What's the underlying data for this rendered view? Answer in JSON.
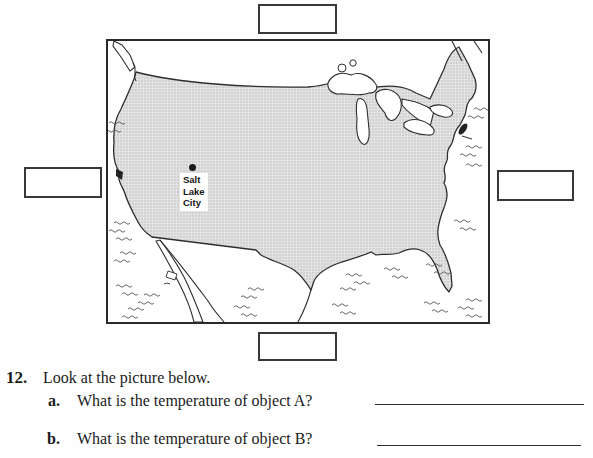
{
  "figure": {
    "map": {
      "name": "united-states-outline-map",
      "city": {
        "label_lines": [
          "Salt",
          "Lake",
          "City"
        ],
        "marker": "salt-lake-city-dot"
      },
      "colors": {
        "land_base": "#e3e3e3",
        "stipple_dot": "#b1b1b1",
        "outline": "#2e2e2e",
        "frame_border": "#2a2a2a"
      }
    },
    "label_boxes": [
      {
        "position": "top",
        "value": ""
      },
      {
        "position": "left",
        "value": ""
      },
      {
        "position": "right",
        "value": ""
      },
      {
        "position": "bottom",
        "value": ""
      }
    ]
  },
  "question": {
    "number": "12.",
    "prompt": "Look at the picture below.",
    "parts": [
      {
        "letter": "a.",
        "text": "What is the temperature of object A?",
        "answer": ""
      },
      {
        "letter": "b.",
        "text": "What is the temperature of object B?",
        "answer": ""
      }
    ]
  }
}
